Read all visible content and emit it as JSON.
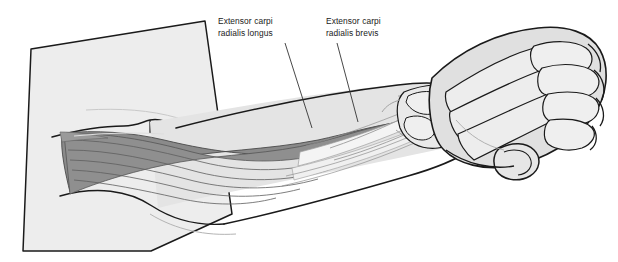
{
  "figure": {
    "kind": "anatomical-illustration",
    "view": "dorsal / posterolateral",
    "style": "grayscale line drawing with flat tonal fills"
  },
  "canvas": {
    "width": 618,
    "height": 262,
    "background": "#ffffff"
  },
  "palette": {
    "background": "#ffffff",
    "outline": "#1a1a1a",
    "skin_upper_arm": "#ededed",
    "skin_forearm": "#e4e4e4",
    "skin_hand": "#e0e0e0",
    "muscle_fill": "#8a8a8a",
    "muscle_fiber_line": "#5e5e5e",
    "tendon_fill": "#f4f4f4",
    "bone_fill": "#e9e9e9",
    "bone_ghost_line": "#9b9b9b",
    "leader_line": "#333333",
    "label_text": "#1a1a1a"
  },
  "labels": [
    {
      "id": "ecrl",
      "line1": "Extensor carpi",
      "line2": "radialis longus",
      "x": 218,
      "y": 16,
      "leader": {
        "x1": 285,
        "y1": 43,
        "x2": 312,
        "y2": 128
      }
    },
    {
      "id": "ecrb",
      "line1": "Extensor carpi",
      "line2": "radialis brevis",
      "x": 326,
      "y": 16,
      "leader": {
        "x1": 337,
        "y1": 43,
        "x2": 358,
        "y2": 122
      }
    }
  ],
  "structures": {
    "upper_arm": "cut-off proximal block with angled distal border",
    "elbow": "lateral epicondyle with common extensor origin",
    "muscles": "extensor carpi radialis longus and brevis bellies with fiber striations",
    "tendons": "long pale tendon bands converging at the wrist",
    "forearm_bones": "radius and ulna shown as ghosted outlines",
    "wrist": "carpal bone cluster",
    "hand": "metacarpals and phalanges of four fingers plus thumb"
  }
}
